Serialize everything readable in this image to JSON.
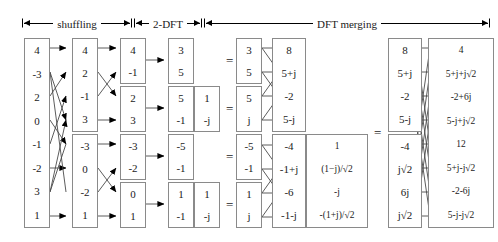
{
  "header": {
    "labels": [
      {
        "text": "shuffling"
      },
      {
        "text": "2-DFT"
      },
      {
        "text": "DFT  merging"
      }
    ]
  },
  "equals": {
    "symbol": "="
  },
  "stages": [
    {
      "name": "input-vector",
      "boxes": [
        {
          "values": [
            "4",
            "-3",
            "2",
            "0",
            "-1",
            "-2",
            "3",
            "1"
          ]
        }
      ]
    },
    {
      "name": "shuffled-vector",
      "boxes": [
        {
          "values": [
            "4",
            "2",
            "-1",
            "3"
          ]
        },
        {
          "values": [
            "-3",
            "0",
            "-2",
            "1"
          ]
        }
      ]
    },
    {
      "name": "pairs-vector",
      "boxes": [
        {
          "values": [
            "4",
            "-1"
          ]
        },
        {
          "values": [
            "2",
            "3"
          ]
        },
        {
          "values": [
            "-3",
            "-2"
          ]
        },
        {
          "values": [
            "0",
            "1"
          ]
        }
      ]
    },
    {
      "name": "two-point-dft",
      "boxes": [
        {
          "values": [
            "3",
            "5"
          ]
        },
        {
          "values": [
            "5",
            "-1"
          ],
          "twiddle": [
            "1",
            "-j"
          ]
        },
        {
          "values": [
            "-5",
            "-1"
          ]
        },
        {
          "values": [
            "1",
            "-1"
          ],
          "twiddle": [
            "1",
            "-j"
          ]
        }
      ]
    },
    {
      "name": "twiddled-pairs",
      "boxes": [
        {
          "values": [
            "3",
            "5"
          ]
        },
        {
          "values": [
            "5",
            "j"
          ]
        },
        {
          "values": [
            "-5",
            "-1"
          ]
        },
        {
          "values": [
            "1",
            "j"
          ]
        }
      ]
    },
    {
      "name": "four-point-dft",
      "boxes": [
        {
          "values": [
            "8",
            "5+j",
            "-2",
            "5-j"
          ]
        },
        {
          "values": [
            "-4",
            "-1+j",
            "-6",
            "-1-j"
          ],
          "twiddle": [
            "1",
            "(1−j)/√2",
            "-j",
            "-(1+j)/√2"
          ]
        }
      ]
    },
    {
      "name": "twiddled-quads",
      "boxes": [
        {
          "values": [
            "8",
            "5+j",
            "-2",
            "5-j"
          ]
        },
        {
          "values": [
            "-4",
            "j√2",
            "6j",
            "j√2"
          ]
        }
      ]
    },
    {
      "name": "eight-point-dft",
      "boxes": [
        {
          "values": [
            "4",
            "5+j+j√2",
            "-2+6j",
            "5-j+j√2",
            "12",
            "5+j-j√2",
            "-2-6j",
            "5-j-j√2"
          ]
        }
      ]
    }
  ]
}
